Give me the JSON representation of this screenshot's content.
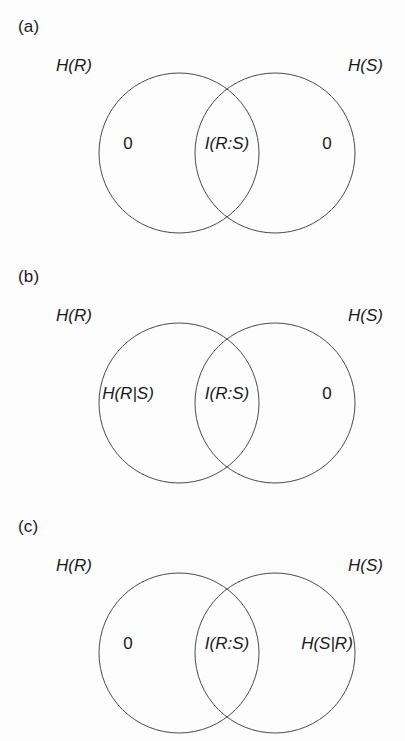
{
  "figure": {
    "background_color": "#fdfdfd",
    "stroke_color": "#4a4a4a",
    "text_color": "#1a1a1a",
    "panel_count": 3
  },
  "panels": [
    {
      "id": "a",
      "label": "(a)",
      "left_set_label": "H(R)",
      "right_set_label": "H(S)",
      "regions": {
        "left": "0",
        "center": "I(R:S)",
        "right": "0"
      },
      "left_region_style": "plain",
      "center_region_style": "italic",
      "right_region_style": "plain"
    },
    {
      "id": "b",
      "label": "(b)",
      "left_set_label": "H(R)",
      "right_set_label": "H(S)",
      "regions": {
        "left": "H(R|S)",
        "center": "I(R:S)",
        "right": "0"
      },
      "left_region_style": "italic",
      "center_region_style": "italic",
      "right_region_style": "plain"
    },
    {
      "id": "c",
      "label": "(c)",
      "left_set_label": "H(R)",
      "right_set_label": "H(S)",
      "regions": {
        "left": "0",
        "center": "I(R:S)",
        "right": "H(S|R)"
      },
      "left_region_style": "plain",
      "center_region_style": "italic",
      "right_region_style": "italic"
    }
  ],
  "geometry": {
    "left_circle_cx": 179,
    "right_circle_cx": 275,
    "circle_cy": 153,
    "circle_r": 80,
    "stroke_width": 1
  }
}
